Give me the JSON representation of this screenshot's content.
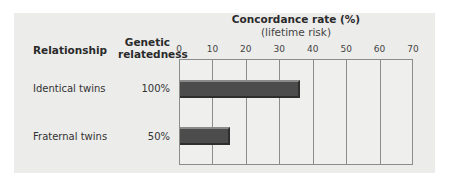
{
  "chart_data": {
    "type": "bar",
    "orientation": "horizontal",
    "title": "Concordance rate (%)",
    "subtitle": "(lifetime risk)",
    "xlabel": "Concordance rate (%) (lifetime risk)",
    "ylabel": "Relationship",
    "xlim": [
      0,
      70
    ],
    "xticks": [
      "0",
      "10",
      "20",
      "30",
      "40",
      "50",
      "60",
      "70"
    ],
    "grid": true,
    "categories": [
      "Identical twins",
      "Fraternal twins"
    ],
    "genetic_relatedness": [
      "100%",
      "50%"
    ],
    "values": [
      36,
      15
    ],
    "bar_color": "#4c4c4c"
  },
  "headers": {
    "relationship": "Relationship",
    "relatedness_line1": "Genetic",
    "relatedness_line2": "relatedness",
    "title": "Concordance rate (%)",
    "subtitle": "(lifetime risk)"
  },
  "rows": [
    {
      "label": "Identical twins",
      "relatedness": "100%"
    },
    {
      "label": "Fraternal twins",
      "relatedness": "50%"
    }
  ],
  "ticks": [
    "0",
    "10",
    "20",
    "30",
    "40",
    "50",
    "60",
    "70"
  ]
}
